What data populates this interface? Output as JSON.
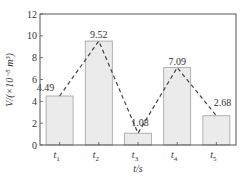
{
  "chart_data": {
    "type": "bar",
    "title": "",
    "xlabel": "t/s",
    "ylabel": "V/(×10⁻⁵ m³)",
    "ylim": [
      0,
      12
    ],
    "yticks": [
      0,
      2,
      4,
      6,
      8,
      10,
      12
    ],
    "categories": [
      "t1",
      "t2",
      "t3",
      "t4",
      "t5"
    ],
    "category_labels": [
      {
        "base": "t",
        "sub": "1"
      },
      {
        "base": "t",
        "sub": "2"
      },
      {
        "base": "t",
        "sub": "3"
      },
      {
        "base": "t",
        "sub": "4"
      },
      {
        "base": "t",
        "sub": "5"
      }
    ],
    "values": [
      4.49,
      9.52,
      1.08,
      7.09,
      2.68
    ],
    "data_labels": [
      "4.49",
      "9.52",
      "1.08",
      "7.09",
      "2.68"
    ],
    "overlay": {
      "type": "dashed-line",
      "connects": "bar tops"
    },
    "grid": false,
    "legend": null
  },
  "colors": {
    "bar_fill": "#ebebeb",
    "bar_stroke": "#a0a0a0",
    "axis": "#555555",
    "dash_line": "#444444"
  }
}
